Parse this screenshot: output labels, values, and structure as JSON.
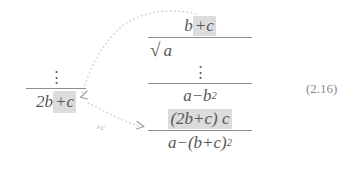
{
  "figure": {
    "equation_number": "(2.16)",
    "text_color": "#575757",
    "highlight_color": "#dcdcdc",
    "annotation_color": "#c8c8c8",
    "rule_color": "#8e8e8e"
  },
  "left_fraction": {
    "numerator_dots": "⋮",
    "denominator": {
      "lead": "2b",
      "highlighted": "+c"
    }
  },
  "right_fraction": {
    "rows": [
      {
        "id": "b-plus-c",
        "lead": "b",
        "highlighted": "+c"
      },
      {
        "id": "sqrt-a",
        "surd": "√",
        "radicand": "a"
      },
      {
        "id": "middle-dots",
        "dots": "⋮"
      },
      {
        "id": "a-minus-b-squared",
        "base": "a−b",
        "exponent": "2"
      },
      {
        "id": "two-b-plus-c-times-c",
        "highlighted": "(2b+c) c"
      },
      {
        "id": "a-minus-b-plus-c-squared",
        "base": "a−(b+c)",
        "exponent": "2"
      }
    ]
  },
  "annotations": {
    "multiplier_label": {
      "operator": "×",
      "operand": "c"
    }
  }
}
